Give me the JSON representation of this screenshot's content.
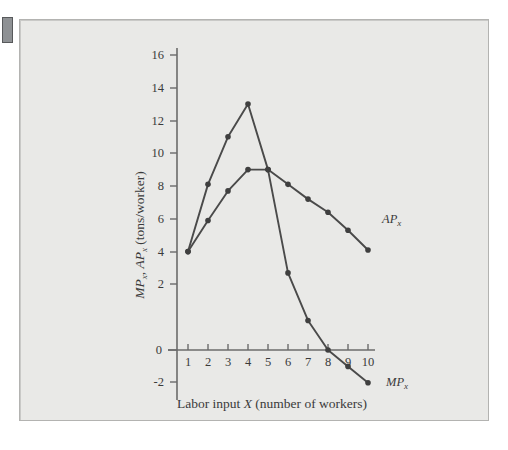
{
  "figure": {
    "background_color": "#e9e9e7",
    "border_color": "#b3b3b1",
    "curve_color": "#4a4a4a",
    "axis_color": "#6b6b6b",
    "text_color": "#3a3a3a"
  },
  "chart_data": {
    "type": "line",
    "title": "",
    "xlabel": "Labor input X (number of workers)",
    "ylabel": "MP x , AP x  (tons/worker)",
    "ylabel_parts": {
      "mp": "MP",
      "mp_sub": "x",
      "comma": ", ",
      "ap": "AP",
      "ap_sub": "x",
      "units": " (tons/worker)"
    },
    "xlabel_parts": {
      "pre": "Labor input ",
      "var": "X",
      "post": " (number of workers)"
    },
    "x": [
      1,
      2,
      3,
      4,
      5,
      6,
      7,
      8,
      9,
      10
    ],
    "xticklabels": [
      "1",
      "2",
      "3",
      "4",
      "5",
      "6",
      "7",
      "8",
      "9",
      "10"
    ],
    "yticklabels": [
      "-2",
      "0",
      "2",
      "4",
      "6",
      "8",
      "10",
      "12",
      "14",
      "16"
    ],
    "yticks": [
      -2,
      0,
      2,
      4,
      6,
      8,
      10,
      12,
      14,
      16
    ],
    "xlim": [
      0.4,
      10.9
    ],
    "ylim": [
      -2,
      17
    ],
    "grid": false,
    "legend": "inline-labels",
    "series": [
      {
        "name": "MP_x",
        "label": "MP",
        "label_sub": "x",
        "values": [
          6.0,
          10.1,
          13.0,
          15.0,
          11.0,
          4.7,
          1.8,
          0.0,
          -1.0,
          -2.0
        ],
        "label_position": {
          "x": 10.55,
          "y": -1.75
        }
      },
      {
        "name": "AP_x",
        "label": "AP",
        "label_sub": "x",
        "values": [
          6.0,
          7.9,
          9.7,
          11.0,
          11.0,
          10.1,
          9.2,
          8.4,
          7.3,
          6.1
        ],
        "label_position": {
          "x": 10.5,
          "y": 5.35
        }
      }
    ]
  }
}
